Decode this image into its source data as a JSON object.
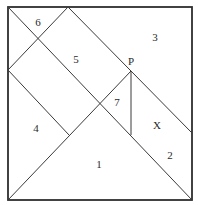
{
  "diagram": {
    "type": "tangram-square-dissection",
    "labels": {
      "piece_1": "1",
      "piece_2": "2",
      "piece_3": "3",
      "piece_4": "4",
      "piece_5": "5",
      "piece_6": "6",
      "piece_7": "7",
      "unknown_piece": "X",
      "point_p": "P"
    }
  }
}
